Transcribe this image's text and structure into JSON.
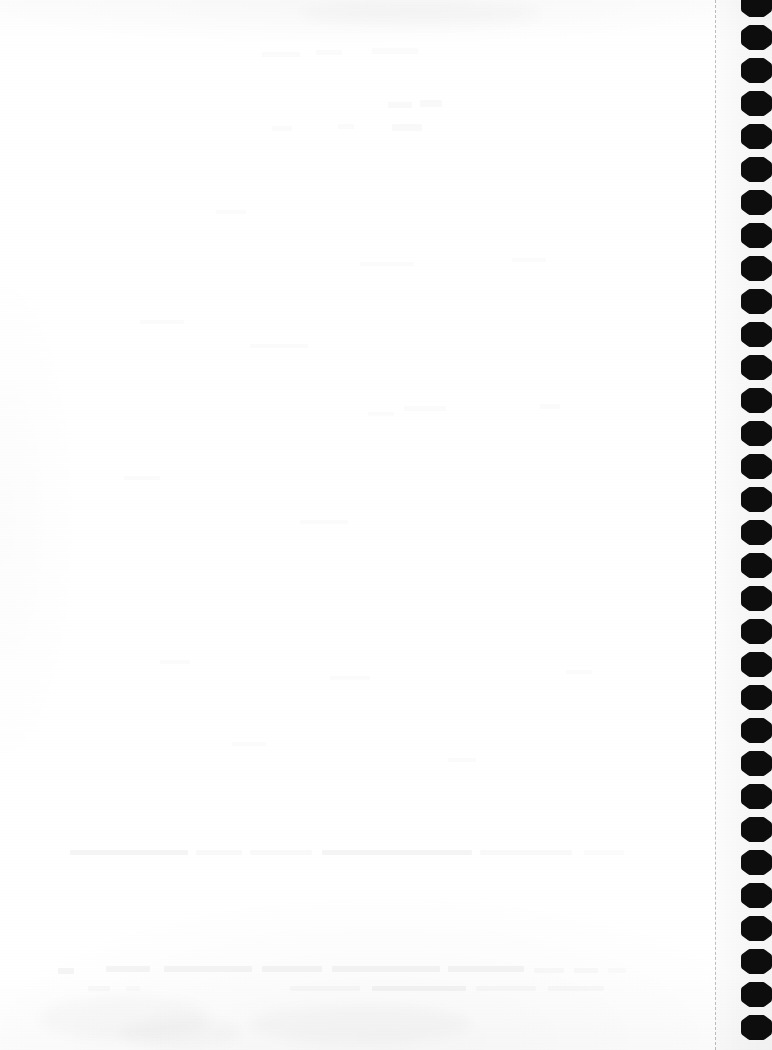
{
  "document": {
    "kind": "scanned-notebook-page",
    "page_state": "blank",
    "visible_text": "",
    "paper_color": "#ffffff",
    "ink_color": "#0d0d0d"
  },
  "binding": {
    "label": "spiral-binding-holes",
    "hole_count": 32,
    "hole_pitch_px": 33,
    "hole_width_px": 31,
    "hole_height_px": 25,
    "first_hole_top_px": -8,
    "column_left_px": 741,
    "hole_color": "#0d0d0d"
  },
  "perforation": {
    "label": "tear-off-perforation",
    "x_px": 715,
    "style": "dashed",
    "color": "#000000"
  },
  "ghost_marks": {
    "note": "faint bleed-through from reverse side; no legible text",
    "blocks": [
      {
        "x": 262,
        "y": 52,
        "w": 38,
        "h": 5,
        "level": "faintest"
      },
      {
        "x": 316,
        "y": 50,
        "w": 26,
        "h": 5,
        "level": "faintest"
      },
      {
        "x": 372,
        "y": 48,
        "w": 46,
        "h": 6,
        "level": "faintest"
      },
      {
        "x": 388,
        "y": 102,
        "w": 24,
        "h": 6,
        "level": "faint"
      },
      {
        "x": 420,
        "y": 100,
        "w": 22,
        "h": 7,
        "level": "faint"
      },
      {
        "x": 392,
        "y": 124,
        "w": 30,
        "h": 7,
        "level": "faint"
      },
      {
        "x": 272,
        "y": 126,
        "w": 20,
        "h": 5,
        "level": "faintest"
      },
      {
        "x": 338,
        "y": 124,
        "w": 16,
        "h": 5,
        "level": "faintest"
      },
      {
        "x": 216,
        "y": 210,
        "w": 30,
        "h": 4,
        "level": "faintest"
      },
      {
        "x": 360,
        "y": 262,
        "w": 54,
        "h": 4,
        "level": "faintest"
      },
      {
        "x": 512,
        "y": 258,
        "w": 34,
        "h": 4,
        "level": "faintest"
      },
      {
        "x": 140,
        "y": 320,
        "w": 44,
        "h": 4,
        "level": "faintest"
      },
      {
        "x": 250,
        "y": 344,
        "w": 58,
        "h": 4,
        "level": "faintest"
      },
      {
        "x": 404,
        "y": 406,
        "w": 42,
        "h": 5,
        "level": "faintest"
      },
      {
        "x": 368,
        "y": 412,
        "w": 26,
        "h": 4,
        "level": "faintest"
      },
      {
        "x": 540,
        "y": 404,
        "w": 20,
        "h": 5,
        "level": "faintest"
      },
      {
        "x": 124,
        "y": 476,
        "w": 36,
        "h": 4,
        "level": "faintest"
      },
      {
        "x": 300,
        "y": 520,
        "w": 48,
        "h": 4,
        "level": "faintest"
      },
      {
        "x": 160,
        "y": 660,
        "w": 30,
        "h": 4,
        "level": "faintest"
      },
      {
        "x": 330,
        "y": 676,
        "w": 40,
        "h": 4,
        "level": "faintest"
      },
      {
        "x": 566,
        "y": 670,
        "w": 26,
        "h": 4,
        "level": "faintest"
      },
      {
        "x": 232,
        "y": 742,
        "w": 34,
        "h": 4,
        "level": "faintest"
      },
      {
        "x": 448,
        "y": 758,
        "w": 28,
        "h": 4,
        "level": "faintest"
      },
      {
        "x": 70,
        "y": 850,
        "w": 118,
        "h": 5,
        "level": "soft"
      },
      {
        "x": 196,
        "y": 850,
        "w": 46,
        "h": 5,
        "level": "faint"
      },
      {
        "x": 250,
        "y": 850,
        "w": 62,
        "h": 5,
        "level": "faint"
      },
      {
        "x": 322,
        "y": 850,
        "w": 150,
        "h": 5,
        "level": "soft"
      },
      {
        "x": 480,
        "y": 850,
        "w": 92,
        "h": 5,
        "level": "faint"
      },
      {
        "x": 584,
        "y": 850,
        "w": 40,
        "h": 5,
        "level": "faintest"
      },
      {
        "x": 58,
        "y": 968,
        "w": 16,
        "h": 6,
        "level": "soft"
      },
      {
        "x": 106,
        "y": 966,
        "w": 44,
        "h": 6,
        "level": "soft"
      },
      {
        "x": 164,
        "y": 966,
        "w": 88,
        "h": 6,
        "level": "soft"
      },
      {
        "x": 262,
        "y": 966,
        "w": 60,
        "h": 6,
        "level": "soft"
      },
      {
        "x": 332,
        "y": 966,
        "w": 108,
        "h": 6,
        "level": "soft"
      },
      {
        "x": 448,
        "y": 966,
        "w": 76,
        "h": 6,
        "level": "soft"
      },
      {
        "x": 534,
        "y": 968,
        "w": 30,
        "h": 5,
        "level": "faint"
      },
      {
        "x": 574,
        "y": 968,
        "w": 24,
        "h": 5,
        "level": "faint"
      },
      {
        "x": 608,
        "y": 968,
        "w": 18,
        "h": 5,
        "level": "faintest"
      },
      {
        "x": 88,
        "y": 986,
        "w": 22,
        "h": 5,
        "level": "faint"
      },
      {
        "x": 126,
        "y": 986,
        "w": 14,
        "h": 5,
        "level": "faintest"
      },
      {
        "x": 290,
        "y": 986,
        "w": 70,
        "h": 5,
        "level": "faint"
      },
      {
        "x": 372,
        "y": 986,
        "w": 94,
        "h": 5,
        "level": "soft"
      },
      {
        "x": 476,
        "y": 986,
        "w": 60,
        "h": 5,
        "level": "faint"
      },
      {
        "x": 548,
        "y": 986,
        "w": 56,
        "h": 5,
        "level": "faint"
      }
    ],
    "smudges": [
      {
        "x": 40,
        "y": 996,
        "w": 170,
        "h": 44
      },
      {
        "x": 250,
        "y": 1004,
        "w": 220,
        "h": 40
      },
      {
        "x": 300,
        "y": 2,
        "w": 240,
        "h": 24
      },
      {
        "x": 120,
        "y": 1018,
        "w": 120,
        "h": 30
      }
    ]
  }
}
